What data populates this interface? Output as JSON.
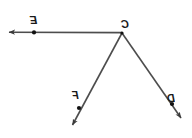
{
  "figure": {
    "background_color": "#ffffff",
    "stroke_color": "#4d4d4d",
    "point_color": "#111111",
    "label_color": "#1a1a1a",
    "mirrored": "true",
    "labels": {
      "vertex": "C",
      "ray_left_point": "E",
      "ray_lower_left_point": "F",
      "ray_lower_right_point": "D"
    },
    "geometry": {
      "vertex": {
        "x": 122,
        "y": 33
      },
      "points": [
        {
          "name": "E",
          "x": 34,
          "y": 32
        },
        {
          "name": "F",
          "x": 79,
          "y": 108
        },
        {
          "name": "D",
          "x": 172,
          "y": 104
        }
      ],
      "rays": [
        {
          "name": "CE",
          "from_x": 122,
          "from_y": 33,
          "to_x": 6,
          "to_y": 32
        },
        {
          "name": "CF",
          "from_x": 122,
          "from_y": 33,
          "to_x": 70,
          "to_y": 129
        },
        {
          "name": "CD",
          "from_x": 122,
          "from_y": 33,
          "to_x": 184,
          "to_y": 122
        }
      ]
    }
  }
}
